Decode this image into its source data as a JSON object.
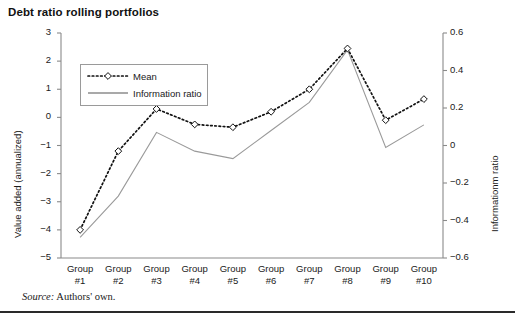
{
  "figure": {
    "title": "Debt ratio rolling portfolios",
    "source_prefix": "Source:",
    "source_text": "Authors' own."
  },
  "chart_data": {
    "type": "line",
    "title": "Debt ratio rolling portfolios",
    "xlabel": "",
    "ylabel": "Value added (annualized)",
    "y2label": "Informationm ratio",
    "categories": [
      "Group #1",
      "Group #2",
      "Group #3",
      "Group #4",
      "Group #5",
      "Group #6",
      "Group #7",
      "Group #8",
      "Group #9",
      "Group #10"
    ],
    "xtick_lines": [
      [
        "Group",
        "#1"
      ],
      [
        "Group",
        "#2"
      ],
      [
        "Group",
        "#3"
      ],
      [
        "Group",
        "#4"
      ],
      [
        "Group",
        "#5"
      ],
      [
        "Group",
        "#6"
      ],
      [
        "Group",
        "#7"
      ],
      [
        "Group",
        "#8"
      ],
      [
        "Group",
        "#9"
      ],
      [
        "Group",
        "#10"
      ]
    ],
    "ylim": [
      -5,
      3
    ],
    "yticks": [
      3,
      2,
      1,
      0,
      -1,
      -2,
      -3,
      -4,
      -5
    ],
    "ytick_labels": [
      "3",
      "2",
      "1",
      "0",
      "−1",
      "−2",
      "−3",
      "−4",
      "−5"
    ],
    "y2lim": [
      -0.6,
      0.6
    ],
    "y2ticks": [
      0.6,
      0.4,
      0.2,
      0,
      -0.2,
      -0.4,
      -0.6
    ],
    "y2tick_labels": [
      "0.6",
      "0.4",
      "0.2",
      "0",
      "−0.2",
      "−0.4",
      "−0.6"
    ],
    "grid": false,
    "legend_position": "upper left",
    "series": [
      {
        "name": "Mean",
        "axis": "left",
        "style": "dashed",
        "marker": "diamond",
        "color": "#111111",
        "values": [
          -4.0,
          -1.2,
          0.3,
          -0.25,
          -0.35,
          0.2,
          1.0,
          2.45,
          -0.1,
          0.65
        ]
      },
      {
        "name": "Information ratio",
        "axis": "right",
        "style": "solid",
        "marker": "none",
        "color": "#9a9a9a",
        "values": [
          -0.49,
          -0.27,
          0.07,
          -0.03,
          -0.07,
          0.08,
          0.23,
          0.51,
          -0.01,
          0.11
        ]
      }
    ]
  },
  "legend": {
    "items": [
      {
        "label": "Mean"
      },
      {
        "label": "Information ratio"
      }
    ]
  }
}
